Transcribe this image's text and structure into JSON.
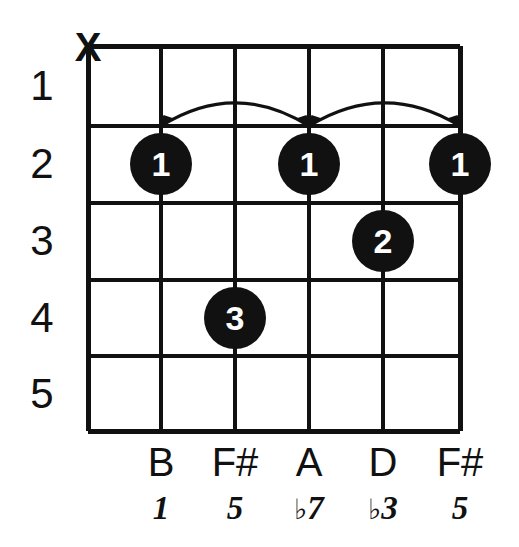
{
  "diagram": {
    "type": "guitar-chord-diagram",
    "title": "",
    "colors": {
      "ink": "#111111",
      "background": "#ffffff",
      "dot_fill": "#111111",
      "dot_text": "#ffffff"
    },
    "grid": {
      "strings": 6,
      "frets": 5,
      "left": 88,
      "right": 460,
      "top": 46,
      "bottom": 431,
      "string_x": [
        88,
        161,
        235,
        309,
        383,
        460
      ],
      "fret_y": [
        46,
        126,
        203,
        280,
        356,
        431
      ]
    },
    "fret_numbers": [
      {
        "label": "1",
        "y": 86
      },
      {
        "label": "2",
        "y": 164
      },
      {
        "label": "3",
        "y": 241
      },
      {
        "label": "4",
        "y": 318
      },
      {
        "label": "5",
        "y": 394
      }
    ],
    "mutes": [
      {
        "marker": "X",
        "string": 1,
        "x": 88,
        "y": 47
      }
    ],
    "dots": [
      {
        "finger": "1",
        "string": 2,
        "fret": 2,
        "x": 161,
        "y": 164
      },
      {
        "finger": "1",
        "string": 4,
        "fret": 2,
        "x": 309,
        "y": 164
      },
      {
        "finger": "1",
        "string": 6,
        "fret": 2,
        "x": 460,
        "y": 164
      },
      {
        "finger": "2",
        "string": 5,
        "fret": 3,
        "x": 383,
        "y": 241
      },
      {
        "finger": "3",
        "string": 3,
        "fret": 4,
        "x": 235,
        "y": 318
      }
    ],
    "barres": [
      {
        "from_string": 2,
        "to_string": 4,
        "fret": 2,
        "x1": 161,
        "x2": 309,
        "y": 126,
        "peak": 97
      },
      {
        "from_string": 4,
        "to_string": 6,
        "fret": 2,
        "x1": 309,
        "x2": 460,
        "y": 126,
        "peak": 97
      }
    ],
    "notes": [
      {
        "name": "B",
        "x": 161,
        "string": 2
      },
      {
        "name": "F#",
        "x": 235,
        "string": 3
      },
      {
        "name": "A",
        "x": 309,
        "string": 4
      },
      {
        "name": "D",
        "x": 383,
        "string": 5
      },
      {
        "name": "F#",
        "x": 460,
        "string": 6
      }
    ],
    "intervals": [
      {
        "flat": "",
        "degree": "1",
        "x": 161
      },
      {
        "flat": "",
        "degree": "5",
        "x": 235
      },
      {
        "flat": "♭",
        "degree": "7",
        "x": 309
      },
      {
        "flat": "♭",
        "degree": "3",
        "x": 383
      },
      {
        "flat": "",
        "degree": "5",
        "x": 460
      }
    ]
  }
}
